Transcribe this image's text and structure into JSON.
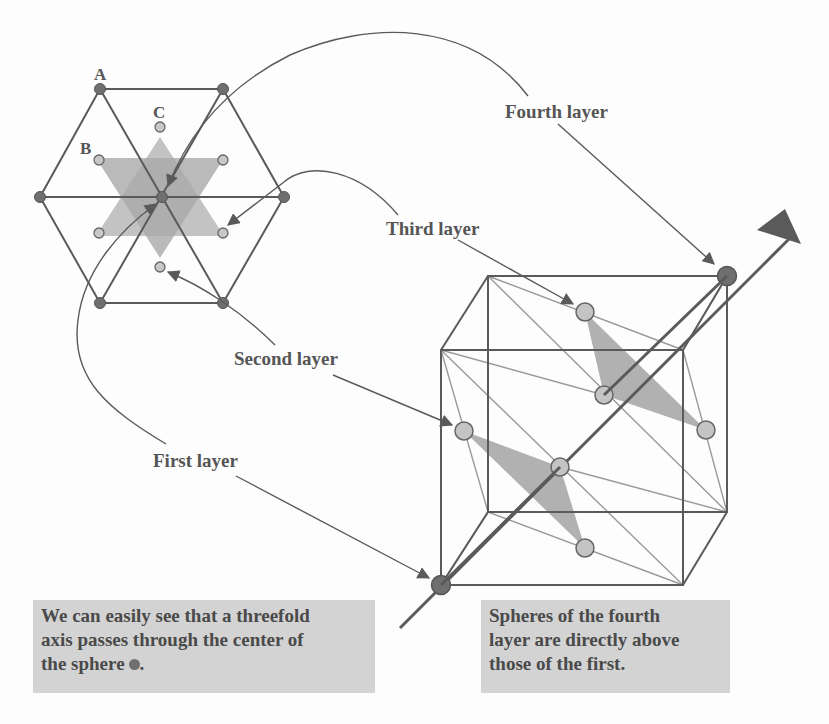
{
  "colors": {
    "background": "#fdfdfd",
    "line": "#5a5a5a",
    "thin_line": "#9a9a9a",
    "dark_sphere": "#6f6f6f",
    "light_sphere": "#c4c4c4",
    "star_fill": "#b8b8b8",
    "note_bg": "#d3d3d3",
    "text": "#555555"
  },
  "hexagon_view": {
    "point_labels": {
      "a": "A",
      "b": "B",
      "c": "C"
    }
  },
  "layer_labels": {
    "first": "First layer",
    "second": "Second layer",
    "third": "Third layer",
    "fourth": "Fourth layer"
  },
  "notes": {
    "left": {
      "line1": "We can easily see that a threefold",
      "line2": "axis passes through the center of",
      "line3": "the sphere",
      "line3_end": "."
    },
    "right": {
      "line1": "Spheres of the fourth",
      "line2": "layer are directly above",
      "line3": "those of the first."
    }
  }
}
